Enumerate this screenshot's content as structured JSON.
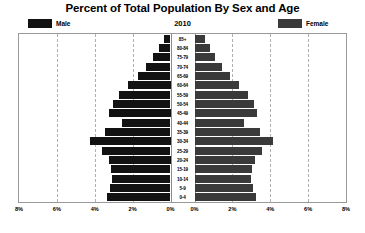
{
  "header": {
    "title": "Percent of Total Population By Sex and Age",
    "year": "2010"
  },
  "legend": {
    "male_label": "Male",
    "female_label": "Female",
    "male_color": "#121212",
    "female_color": "#3a3a3a"
  },
  "axis": {
    "tick_labels_left": [
      "8%",
      "6%",
      "4%",
      "2%",
      "0%"
    ],
    "tick_labels_right": [
      "0%",
      "2%",
      "4%",
      "6%",
      "8%"
    ]
  },
  "chart_data": {
    "type": "bar",
    "subtype": "population-pyramid",
    "title": "Percent of Total Population By Sex and Age",
    "subtitle": "2010",
    "xlabel": "",
    "ylabel": "",
    "xlim": [
      0,
      8
    ],
    "xtick_values": [
      0,
      2,
      4,
      6,
      8
    ],
    "grid": true,
    "gridline_values": [
      2,
      4,
      6
    ],
    "legend_position": "top",
    "orientation": "horizontal",
    "categories": [
      "85+",
      "80-84",
      "75-79",
      "70-74",
      "65-69",
      "60-64",
      "55-59",
      "50-54",
      "45-49",
      "40-44",
      "35-39",
      "30-34",
      "25-29",
      "20-24",
      "15-19",
      "10-14",
      "5-9",
      "0-4"
    ],
    "series": [
      {
        "name": "Male",
        "side": "left",
        "color": "#121212",
        "values": [
          0.35,
          0.62,
          0.95,
          1.3,
          1.72,
          2.25,
          2.7,
          3.05,
          3.25,
          2.55,
          3.45,
          4.25,
          3.6,
          3.25,
          3.15,
          3.1,
          3.2,
          3.35
        ]
      },
      {
        "name": "Female",
        "side": "right",
        "color": "#3a3a3a",
        "values": [
          0.55,
          0.8,
          1.1,
          1.45,
          1.85,
          2.35,
          2.8,
          3.15,
          3.3,
          2.6,
          3.45,
          4.15,
          3.55,
          3.2,
          3.05,
          3.0,
          3.1,
          3.25
        ]
      }
    ]
  }
}
